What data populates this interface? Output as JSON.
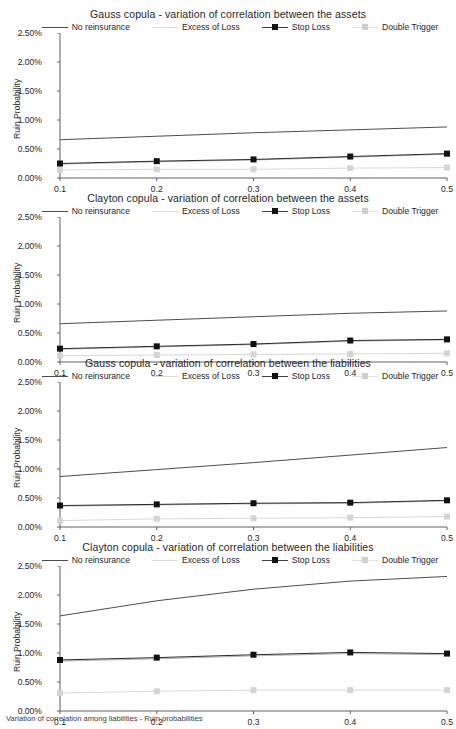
{
  "figure": {
    "caption": "Variation of correlation among liabilities - Ruin probabilities"
  },
  "axis": {
    "ylabel": "Ruin Probability",
    "yticks": [
      "0.00%",
      "0.50%",
      "1.00%",
      "1.50%",
      "2.00%",
      "2.50%"
    ],
    "xticks": [
      "0.1",
      "0.2",
      "0.3",
      "0.4",
      "0.5"
    ]
  },
  "legend": {
    "items": [
      {
        "label": "No reinsurance",
        "color": "#4d4d4d",
        "marker": "none",
        "markerColor": "#4d4d4d"
      },
      {
        "label": "Excess of Loss",
        "color": "#dcdcdc",
        "marker": "none",
        "markerColor": "#dcdcdc"
      },
      {
        "label": "Stop Loss",
        "color": "#3f3f3f",
        "marker": "square",
        "markerColor": "#111111"
      },
      {
        "label": "Double Trigger",
        "color": "#e2e2e2",
        "marker": "square",
        "markerColor": "#cfcfcf"
      }
    ]
  },
  "chart_data": [
    {
      "type": "line",
      "title": "Gauss copula - variation of correlation between the assets",
      "xlabel": "",
      "ylabel": "Ruin Probability",
      "x": [
        0.1,
        0.2,
        0.3,
        0.4,
        0.5
      ],
      "ylim": [
        0,
        2.5
      ],
      "xlim": [
        0.1,
        0.5
      ],
      "yunit": "%",
      "grid": false,
      "legend_position": "top",
      "series": [
        {
          "name": "No reinsurance",
          "values": [
            0.66,
            0.72,
            0.78,
            0.83,
            0.88
          ],
          "color": "#4d4d4d",
          "marker": "none"
        },
        {
          "name": "Excess of Loss",
          "values": [
            0.24,
            0.28,
            0.31,
            0.36,
            0.41
          ],
          "color": "#b4b4b4",
          "marker": "none"
        },
        {
          "name": "Stop Loss",
          "values": [
            0.25,
            0.29,
            0.32,
            0.37,
            0.42
          ],
          "color": "#2a2a2a",
          "marker": "square"
        },
        {
          "name": "Double Trigger",
          "values": [
            0.14,
            0.15,
            0.15,
            0.17,
            0.18
          ],
          "color": "#d8d8d8",
          "marker": "square"
        }
      ]
    },
    {
      "type": "line",
      "title": "Clayton copula - variation of correlation between the assets",
      "xlabel": "",
      "ylabel": "Ruin Probability",
      "x": [
        0.1,
        0.2,
        0.3,
        0.4,
        0.5
      ],
      "ylim": [
        0,
        2.5
      ],
      "xlim": [
        0.1,
        0.5
      ],
      "yunit": "%",
      "grid": false,
      "legend_position": "top",
      "series": [
        {
          "name": "No reinsurance",
          "values": [
            0.66,
            0.72,
            0.78,
            0.84,
            0.88
          ],
          "color": "#4d4d4d",
          "marker": "none"
        },
        {
          "name": "Excess of Loss",
          "values": [
            0.22,
            0.26,
            0.3,
            0.36,
            0.38
          ],
          "color": "#b4b4b4",
          "marker": "none"
        },
        {
          "name": "Stop Loss",
          "values": [
            0.23,
            0.27,
            0.31,
            0.37,
            0.39
          ],
          "color": "#2a2a2a",
          "marker": "square"
        },
        {
          "name": "Double Trigger",
          "values": [
            0.11,
            0.12,
            0.13,
            0.14,
            0.15
          ],
          "color": "#d8d8d8",
          "marker": "square"
        }
      ]
    },
    {
      "type": "line",
      "title": "Gauss copula - variation of correlation between the liabilities",
      "xlabel": "",
      "ylabel": "Ruin Probability",
      "x": [
        0.1,
        0.2,
        0.3,
        0.4,
        0.5
      ],
      "ylim": [
        0,
        2.5
      ],
      "xlim": [
        0.1,
        0.5
      ],
      "yunit": "%",
      "grid": false,
      "legend_position": "top",
      "series": [
        {
          "name": "No reinsurance",
          "values": [
            0.87,
            0.99,
            1.11,
            1.24,
            1.37
          ],
          "color": "#4d4d4d",
          "marker": "none"
        },
        {
          "name": "Excess of Loss",
          "values": [
            0.36,
            0.38,
            0.4,
            0.41,
            0.45
          ],
          "color": "#b4b4b4",
          "marker": "none"
        },
        {
          "name": "Stop Loss",
          "values": [
            0.37,
            0.39,
            0.41,
            0.42,
            0.46
          ],
          "color": "#2a2a2a",
          "marker": "square"
        },
        {
          "name": "Double Trigger",
          "values": [
            0.11,
            0.14,
            0.15,
            0.16,
            0.18
          ],
          "color": "#d8d8d8",
          "marker": "square"
        }
      ]
    },
    {
      "type": "line",
      "title": "Clayton copula - variation of correlation between the liabilities",
      "xlabel": "",
      "ylabel": "Ruin Probability",
      "x": [
        0.1,
        0.2,
        0.3,
        0.4,
        0.5
      ],
      "ylim": [
        0,
        2.5
      ],
      "xlim": [
        0.1,
        0.5
      ],
      "yunit": "%",
      "grid": false,
      "legend_position": "top",
      "series": [
        {
          "name": "No reinsurance",
          "values": [
            1.64,
            1.9,
            2.1,
            2.24,
            2.32
          ],
          "color": "#4d4d4d",
          "marker": "none"
        },
        {
          "name": "Excess of Loss",
          "values": [
            0.86,
            0.9,
            0.95,
            0.99,
            0.97
          ],
          "color": "#b4b4b4",
          "marker": "none"
        },
        {
          "name": "Stop Loss",
          "values": [
            0.88,
            0.92,
            0.97,
            1.01,
            0.99
          ],
          "color": "#2a2a2a",
          "marker": "square"
        },
        {
          "name": "Double Trigger",
          "values": [
            0.31,
            0.34,
            0.36,
            0.36,
            0.36
          ],
          "color": "#d8d8d8",
          "marker": "square"
        }
      ]
    }
  ]
}
